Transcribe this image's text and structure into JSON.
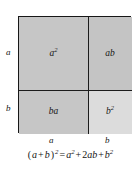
{
  "figure": {
    "colors": {
      "background": "#ffffff",
      "outline": "#171717",
      "cell_a2_fill": "#c6c6c6",
      "cell_ab_fill": "#c4c4c4",
      "cell_ba_fill": "#c6c6c6",
      "cell_b2_fill": "#dcdcdc",
      "text": "#141414"
    }
  },
  "cells": [
    {
      "id": "a-squared",
      "base": "a",
      "exponent": "2",
      "label": "a²",
      "position": "top-left"
    },
    {
      "id": "ab",
      "base": "ab",
      "exponent": "",
      "label": "ab",
      "position": "top-right"
    },
    {
      "id": "ba",
      "base": "ba",
      "exponent": "",
      "label": "ba",
      "position": "bottom-left"
    },
    {
      "id": "b-squared",
      "base": "b",
      "exponent": "2",
      "label": "b²",
      "position": "bottom-right"
    }
  ],
  "edge_labels": {
    "left_top": "a",
    "left_bottom": "b",
    "bottom_left": "a",
    "bottom_right": "b"
  },
  "equation": {
    "full_text": "(a + b)² = a² + 2ab + b²",
    "lhs_open": "(",
    "lhs_a": "a",
    "lhs_plus": "+",
    "lhs_b": "b",
    "lhs_close": ")",
    "lhs_exponent": "2",
    "equals": "=",
    "term1_base": "a",
    "term1_exponent": "2",
    "plus1": "+",
    "term2_coefficient": "2",
    "term2_base": "ab",
    "plus2": "+",
    "term3_base": "b",
    "term3_exponent": "2"
  }
}
